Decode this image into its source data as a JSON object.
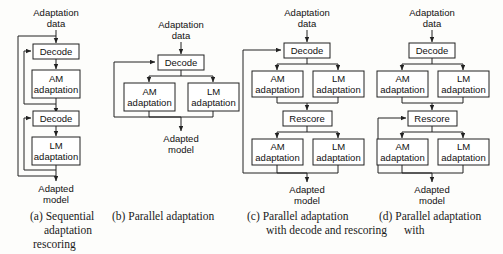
{
  "figure": {
    "line_color": "#222222",
    "box_fill": "#ffffff",
    "background": "#fdfdfb"
  },
  "labels": {
    "adaptation_data_1": "Adaptation",
    "adaptation_data_2": "data",
    "adapted_model_1": "Adapted",
    "adapted_model_2": "model",
    "decode": "Decode",
    "rescore": "Rescore",
    "am_1": "AM",
    "am_2": "adaptation",
    "lm_1": "LM",
    "lm_2": "adaptation"
  },
  "panels": [
    {
      "id": "a",
      "caption_lines": [
        "(a) Sequential",
        "adaptation",
        "rescoring"
      ],
      "input": "Adaptation data",
      "output": "Adapted model",
      "blocks": [
        "Decode",
        "AM adaptation",
        "Decode",
        "LM adaptation"
      ],
      "feedback": "two nested loops returning to each Decode"
    },
    {
      "id": "b",
      "caption_lines": [
        "(b) Parallel adaptation"
      ],
      "input": "Adaptation data",
      "output": "Adapted model",
      "blocks": [
        "Decode",
        "AM adaptation",
        "LM adaptation"
      ],
      "feedback": "merge output loops back to Decode"
    },
    {
      "id": "c",
      "caption_lines": [
        "(c) Parallel adaptation",
        "with decode and rescoring"
      ],
      "input": "Adaptation data",
      "output": "Adapted model",
      "blocks": [
        "Decode",
        "AM adaptation",
        "LM adaptation",
        "Rescore",
        "AM adaptation",
        "LM adaptation"
      ],
      "feedback": "final merge loops back to Decode"
    },
    {
      "id": "d",
      "caption_lines": [
        "(d) Parallel adaptation",
        "with"
      ],
      "input": "Adaptation data",
      "output": "Adapted model",
      "blocks": [
        "Decode",
        "AM adaptation",
        "LM adaptation",
        "Rescore",
        "AM adaptation",
        "LM adaptation"
      ],
      "feedback": "final merge loops back to Rescore"
    }
  ],
  "captions": {
    "a": {
      "l1": "(a) Sequential",
      "l2": "adaptation",
      "l3": "rescoring"
    },
    "b": {
      "l1": "(b) Parallel adaptation"
    },
    "c": {
      "l1": "(c) Parallel adaptation",
      "l2": "with decode and rescoring"
    },
    "d": {
      "l1": "(d) Parallel adaptation",
      "l2": "with"
    }
  }
}
